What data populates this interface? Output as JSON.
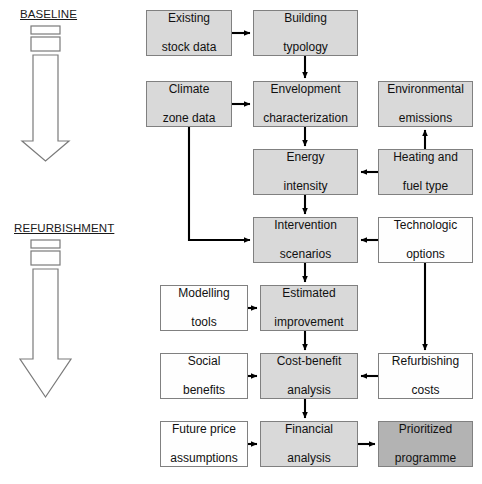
{
  "diagram": {
    "phases": [
      {
        "id": "baseline",
        "label": "BASELINE",
        "x": 20,
        "y": 8,
        "arrow_top": 26,
        "arrow_bottom": 160
      },
      {
        "id": "refurbishment",
        "label": "REFURBISHMENT",
        "x": 14,
        "y": 222,
        "arrow_top": 240,
        "arrow_bottom": 396
      }
    ],
    "nodes": [
      {
        "id": "existing-stock-data",
        "label": "Existing\nstock data",
        "lines": [
          "Existing",
          "stock data"
        ],
        "x": 146,
        "y": 10,
        "w": 86,
        "h": 46,
        "fill": "light"
      },
      {
        "id": "building-typology",
        "label": "Building\ntypology",
        "lines": [
          "Building",
          "typology"
        ],
        "x": 253,
        "y": 10,
        "w": 105,
        "h": 46,
        "fill": "light"
      },
      {
        "id": "climate-zone-data",
        "label": "Climate\nzone data",
        "lines": [
          "Climate",
          "zone data"
        ],
        "x": 146,
        "y": 81,
        "w": 86,
        "h": 46,
        "fill": "light"
      },
      {
        "id": "envelopment-characterization",
        "label": "Envelopment\ncharacterization",
        "lines": [
          "Envelopment",
          "characterization"
        ],
        "x": 253,
        "y": 81,
        "w": 105,
        "h": 46,
        "fill": "light"
      },
      {
        "id": "environmental-emissions",
        "label": "Environmental\nemissions",
        "lines": [
          "Environmental",
          "emissions"
        ],
        "x": 378,
        "y": 81,
        "w": 95,
        "h": 46,
        "fill": "light"
      },
      {
        "id": "energy-intensity",
        "label": "Energy\nintensity",
        "lines": [
          "Energy",
          "intensity"
        ],
        "x": 253,
        "y": 149,
        "w": 105,
        "h": 46,
        "fill": "light"
      },
      {
        "id": "heating-and-fuel-type",
        "label": "Heating and\nfuel type",
        "lines": [
          "Heating and",
          "fuel type"
        ],
        "x": 378,
        "y": 149,
        "w": 95,
        "h": 46,
        "fill": "light"
      },
      {
        "id": "intervention-scenarios",
        "label": "Intervention\nscenarios",
        "lines": [
          "Intervention",
          "scenarios"
        ],
        "x": 253,
        "y": 217,
        "w": 105,
        "h": 46,
        "fill": "light"
      },
      {
        "id": "technologic-options",
        "label": "Technologic\noptions",
        "lines": [
          "Technologic",
          "options"
        ],
        "x": 378,
        "y": 217,
        "w": 95,
        "h": 46,
        "fill": "white"
      },
      {
        "id": "modelling-tools",
        "label": "Modelling\ntools",
        "lines": [
          "Modelling",
          "tools"
        ],
        "x": 160,
        "y": 285,
        "w": 88,
        "h": 46,
        "fill": "white"
      },
      {
        "id": "estimated-improvement",
        "label": "Estimated\nimprovement",
        "lines": [
          "Estimated",
          "improvement"
        ],
        "x": 260,
        "y": 285,
        "w": 98,
        "h": 46,
        "fill": "light"
      },
      {
        "id": "social-benefits",
        "label": "Social\nbenefits",
        "lines": [
          "Social",
          "benefits"
        ],
        "x": 160,
        "y": 353,
        "w": 88,
        "h": 46,
        "fill": "white"
      },
      {
        "id": "cost-benefit-analysis",
        "label": "Cost-benefit\nanalysis",
        "lines": [
          "Cost-benefit",
          "analysis"
        ],
        "x": 260,
        "y": 353,
        "w": 98,
        "h": 46,
        "fill": "light"
      },
      {
        "id": "refurbishing-costs",
        "label": "Refurbishing\ncosts",
        "lines": [
          "Refurbishing",
          "costs"
        ],
        "x": 378,
        "y": 353,
        "w": 95,
        "h": 46,
        "fill": "white"
      },
      {
        "id": "future-price-assumptions",
        "label": "Future price\nassumptions",
        "lines": [
          "Future price",
          "assumptions"
        ],
        "x": 160,
        "y": 421,
        "w": 88,
        "h": 46,
        "fill": "white"
      },
      {
        "id": "financial-analysis",
        "label": "Financial\nanalysis",
        "lines": [
          "Financial",
          "analysis"
        ],
        "x": 260,
        "y": 421,
        "w": 98,
        "h": 46,
        "fill": "light"
      },
      {
        "id": "prioritized-programme",
        "label": "Prioritized\nprogramme",
        "lines": [
          "Prioritized",
          "programme"
        ],
        "x": 378,
        "y": 421,
        "w": 95,
        "h": 46,
        "fill": "dark"
      }
    ],
    "edges": [
      {
        "id": "edge-existing-stock-to-building-typology",
        "from": "existing-stock-data",
        "to": "building-typology"
      },
      {
        "id": "edge-building-typology-to-envelopment",
        "from": "building-typology",
        "to": "envelopment-characterization"
      },
      {
        "id": "edge-climate-zone-to-envelopment",
        "from": "climate-zone-data",
        "to": "envelopment-characterization"
      },
      {
        "id": "edge-climate-zone-to-intervention",
        "from": "climate-zone-data",
        "to": "intervention-scenarios"
      },
      {
        "id": "edge-envelopment-to-energy-intensity",
        "from": "envelopment-characterization",
        "to": "energy-intensity"
      },
      {
        "id": "edge-heating-fuel-to-energy-intensity",
        "from": "heating-and-fuel-type",
        "to": "energy-intensity"
      },
      {
        "id": "edge-heating-fuel-to-environmental-emissions",
        "from": "heating-and-fuel-type",
        "to": "environmental-emissions"
      },
      {
        "id": "edge-energy-intensity-to-intervention",
        "from": "energy-intensity",
        "to": "intervention-scenarios"
      },
      {
        "id": "edge-technologic-options-to-intervention",
        "from": "technologic-options",
        "to": "intervention-scenarios"
      },
      {
        "id": "edge-technologic-options-to-refurbishing-costs",
        "from": "technologic-options",
        "to": "refurbishing-costs"
      },
      {
        "id": "edge-intervention-to-estimated-improvement",
        "from": "intervention-scenarios",
        "to": "estimated-improvement"
      },
      {
        "id": "edge-modelling-tools-to-estimated-improvement",
        "from": "modelling-tools",
        "to": "estimated-improvement"
      },
      {
        "id": "edge-estimated-improvement-to-cost-benefit",
        "from": "estimated-improvement",
        "to": "cost-benefit-analysis"
      },
      {
        "id": "edge-social-benefits-to-cost-benefit",
        "from": "social-benefits",
        "to": "cost-benefit-analysis"
      },
      {
        "id": "edge-refurbishing-costs-to-cost-benefit",
        "from": "refurbishing-costs",
        "to": "cost-benefit-analysis"
      },
      {
        "id": "edge-cost-benefit-to-financial-analysis",
        "from": "cost-benefit-analysis",
        "to": "financial-analysis"
      },
      {
        "id": "edge-future-price-to-financial-analysis",
        "from": "future-price-assumptions",
        "to": "financial-analysis"
      },
      {
        "id": "edge-financial-analysis-to-prioritized-programme",
        "from": "financial-analysis",
        "to": "prioritized-programme"
      }
    ],
    "colors": {
      "node_fill_light": "#d9d9d9",
      "node_fill_dark": "#b3b3b3",
      "node_fill_white": "#fefefe",
      "node_border": "#808080",
      "connector": "#000000",
      "phase_arrow_stroke": "#7a7a7a",
      "text": "#111111",
      "background": "#ffffff"
    }
  }
}
